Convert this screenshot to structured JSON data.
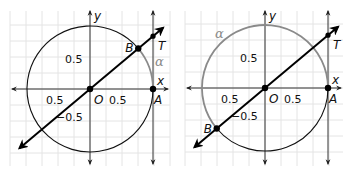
{
  "panels": [
    {
      "id": "left",
      "angle_deg": 40,
      "alpha_arc": "short",
      "labels": {
        "x_axis": "x",
        "y_axis": "y",
        "origin": "O",
        "point_a": "A",
        "point_b": "B",
        "point_t": "T",
        "alpha": "α",
        "tick_y_pos": "0.5",
        "tick_x_neg": "0.5",
        "tick_x_pos": "0.5",
        "tick_y_neg": "−0.5"
      }
    },
    {
      "id": "right",
      "angle_deg": 220,
      "alpha_arc": "long",
      "labels": {
        "x_axis": "x",
        "y_axis": "y",
        "origin": "O",
        "point_a": "A",
        "point_b": "B",
        "point_t": "T",
        "alpha": "α",
        "tick_y_pos": "0.5",
        "tick_x_neg": "0.5",
        "tick_x_pos": "0.5",
        "tick_y_neg": "−0.5"
      }
    }
  ],
  "colors": {
    "grid": "#e4e4e4",
    "axis": "#333333",
    "circle": "#111111",
    "arc_alpha": "#8a8a8a",
    "line": "#000000"
  }
}
